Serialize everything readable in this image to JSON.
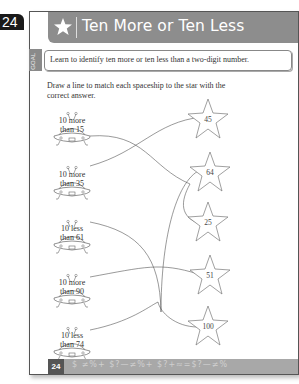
{
  "page_tab": {
    "number": "24"
  },
  "header": {
    "title": "Ten More or Ten Less",
    "icon": "star-icon"
  },
  "goal": {
    "tab_label": "GOAL",
    "text": "Learn to identify ten more or ten less than a two-digit number."
  },
  "instruction": "Draw a line to match each spaceship to the star with the correct answer.",
  "spaceships": [
    {
      "line1": "10 more",
      "line2": "than 15"
    },
    {
      "line1": "10 more",
      "line2": "than 35"
    },
    {
      "line1": "10 less",
      "line2": "than 61"
    },
    {
      "line1": "10 more",
      "line2": "than 90"
    },
    {
      "line1": "10 less",
      "line2": "than 74"
    }
  ],
  "stars": [
    "45",
    "64",
    "25",
    "51",
    "100"
  ],
  "footer": {
    "page_number": "24",
    "decoration": "$ ≠%+ $?—≠%+ $?+≈=$?—≠%"
  },
  "colors": {
    "header_bg": "#8d8d8d",
    "footer_bg": "#a8a8a8",
    "tab_bg": "#1a1a1a"
  }
}
